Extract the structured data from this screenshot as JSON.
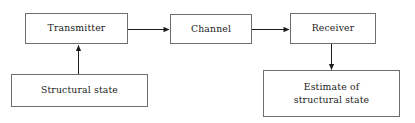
{
  "diagram": {
    "type": "block-flow-diagram",
    "canvas": {
      "width": 415,
      "height": 123,
      "background": "#ffffff"
    },
    "style": {
      "border_color": "#6e6e6e",
      "arrow_color": "#1c1c1c",
      "text_color": "#1c1c1c"
    },
    "nodes": [
      {
        "id": "transmitter",
        "label": "Transmitter",
        "x": 25,
        "y": 13,
        "w": 103,
        "h": 31
      },
      {
        "id": "channel",
        "label": "Channel",
        "x": 170,
        "y": 14,
        "w": 82,
        "h": 30
      },
      {
        "id": "receiver",
        "label": "Receiver",
        "x": 290,
        "y": 13,
        "w": 86,
        "h": 31
      },
      {
        "id": "structural_state",
        "label": "Structural state",
        "x": 11,
        "y": 74,
        "w": 137,
        "h": 33
      },
      {
        "id": "estimate",
        "label": "Estimate of\nstructural state",
        "x": 263,
        "y": 70,
        "w": 137,
        "h": 47
      }
    ],
    "edges": [
      {
        "id": "structural-state-to-transmitter",
        "from": "structural_state",
        "to": "transmitter",
        "direction": "up"
      },
      {
        "id": "transmitter-to-channel",
        "from": "transmitter",
        "to": "channel",
        "direction": "right"
      },
      {
        "id": "channel-to-receiver",
        "from": "channel",
        "to": "receiver",
        "direction": "right"
      },
      {
        "id": "receiver-to-estimate",
        "from": "receiver",
        "to": "estimate",
        "direction": "down"
      }
    ]
  }
}
